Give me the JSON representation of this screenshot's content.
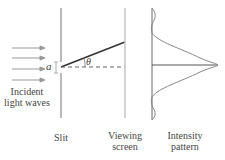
{
  "diagram": {
    "labels": {
      "incident_line1": "Incident",
      "incident_line2": "light waves",
      "slit": "Slit",
      "screen_line1": "Viewing",
      "screen_line2": "screen",
      "intensity_line1": "Intensity",
      "intensity_line2": "pattern",
      "slit_width_symbol": "a",
      "angle_symbol": "θ"
    },
    "colors": {
      "wall": "#b8b8b8",
      "ray": "#333333",
      "arrow": "#999999",
      "curve": "#888888",
      "text": "#444444"
    }
  }
}
